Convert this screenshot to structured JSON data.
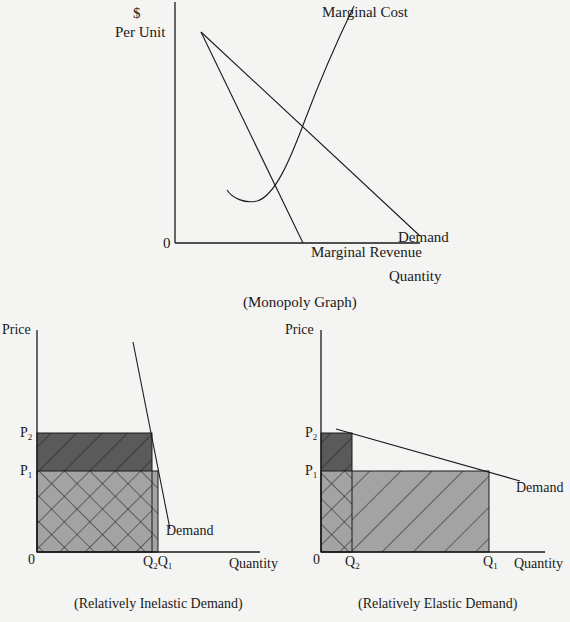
{
  "monopoly": {
    "y_axis_label_line1": "$",
    "y_axis_label_line2": "Per Unit",
    "x_axis_label": "Quantity",
    "origin_label": "0",
    "curves": {
      "marginal_cost": "Marginal Cost",
      "demand": "Demand",
      "marginal_revenue": "Marginal Revenue"
    },
    "caption": "(Monopoly Graph)"
  },
  "inelastic": {
    "y_axis_label": "Price",
    "x_axis_label": "Quantity",
    "origin_label": "0",
    "p2": "P",
    "p2_sub": "2",
    "p1": "P",
    "p1_sub": "1",
    "q2": "Q",
    "q2_sub": "2",
    "q1": "Q",
    "q1_sub": "1",
    "demand_label": "Demand",
    "caption": "(Relatively Inelastic Demand)"
  },
  "elastic": {
    "y_axis_label": "Price",
    "x_axis_label": "Quantity",
    "origin_label": "0",
    "p2": "P",
    "p2_sub": "2",
    "p1": "P",
    "p1_sub": "1",
    "q2": "Q",
    "q2_sub": "2",
    "q1": "Q",
    "q1_sub": "1",
    "demand_label": "Demand",
    "caption": "(Relatively Elastic Demand)"
  },
  "colors": {
    "dark_fill": "#5a5a5a",
    "light_fill": "#a3a3a3",
    "line": "#1a1a1a",
    "background": "#f4f4f2"
  }
}
